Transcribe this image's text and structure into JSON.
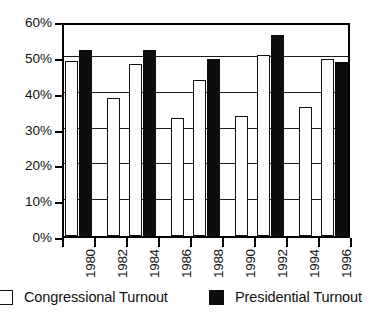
{
  "chart_data": {
    "type": "bar",
    "title": "",
    "xlabel": "",
    "ylabel": "",
    "categories": [
      "1980",
      "1982",
      "1984",
      "1986",
      "1988",
      "1990",
      "1992",
      "1994",
      "1996"
    ],
    "ylim": [
      0,
      60
    ],
    "ytick_values": [
      0,
      10,
      20,
      30,
      40,
      50,
      60
    ],
    "ytick_labels": [
      "0%",
      "10%",
      "20%",
      "30%",
      "40%",
      "50%",
      "60%"
    ],
    "grid": true,
    "legend_position": "bottom",
    "series": [
      {
        "name": "Congressional Turnout",
        "swatch": "open",
        "color": "#ffffff",
        "edge_color": "#111111",
        "values": [
          48.8,
          38.5,
          48.0,
          33.0,
          43.5,
          33.5,
          50.5,
          36.0,
          49.5
        ]
      },
      {
        "name": "Presidential Turnout",
        "swatch": "filled",
        "color": "#0d0d0d",
        "edge_color": "#0d0d0d",
        "values": [
          52.0,
          null,
          52.0,
          null,
          49.5,
          null,
          56.0,
          null,
          48.5
        ]
      }
    ]
  },
  "legend": {
    "items": [
      {
        "label": "Congressional Turnout",
        "swatch": "open"
      },
      {
        "label": "Presidential Turnout",
        "swatch": "filled"
      }
    ]
  },
  "colors": {
    "congressional": "#ffffff",
    "presidential": "#0d0d0d",
    "axis": "#000000",
    "grid": "#1a1a1a",
    "background": "#ffffff"
  }
}
